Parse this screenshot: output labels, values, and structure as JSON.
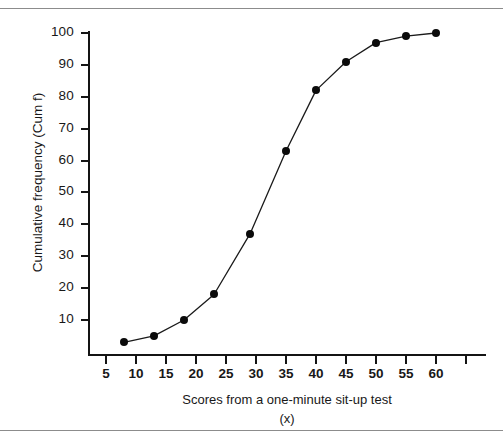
{
  "figure": {
    "top_caption": "",
    "x_axis_title": "Scores from a one-minute sit-up test",
    "x_axis_subtitle": "(x)",
    "y_axis_title": "Cumulative frequency (Cum f)"
  },
  "colors": {
    "line": "#1a1a1a",
    "marker": "#0b0b0b",
    "axis": "#141414",
    "rule": "#8c8c8c",
    "background": "#ffffff"
  },
  "chart_data": {
    "type": "line",
    "title": "",
    "xlabel": "Scores from a one-minute sit-up test (x)",
    "ylabel": "Cumulative frequency (Cum f)",
    "xlim": [
      2,
      65
    ],
    "ylim": [
      0,
      104
    ],
    "grid": false,
    "legend": "none",
    "xticks": [
      5,
      10,
      15,
      20,
      25,
      30,
      35,
      40,
      45,
      50,
      55,
      60
    ],
    "yticks": [
      10,
      20,
      30,
      40,
      50,
      60,
      70,
      80,
      90,
      100
    ],
    "x": [
      8,
      13,
      18,
      23,
      29,
      35,
      40,
      45,
      50,
      55,
      60
    ],
    "y": [
      3,
      5,
      10,
      18,
      37,
      63,
      82,
      91,
      97,
      99,
      100
    ],
    "series": [
      {
        "name": "Cumulative frequency",
        "points": [
          {
            "x": 8,
            "y": 3
          },
          {
            "x": 13,
            "y": 5
          },
          {
            "x": 18,
            "y": 10
          },
          {
            "x": 23,
            "y": 18
          },
          {
            "x": 29,
            "y": 37
          },
          {
            "x": 35,
            "y": 63
          },
          {
            "x": 40,
            "y": 82
          },
          {
            "x": 45,
            "y": 91
          },
          {
            "x": 50,
            "y": 97
          },
          {
            "x": 55,
            "y": 99
          },
          {
            "x": 60,
            "y": 100
          }
        ],
        "marker": "filled-circle",
        "line_style": "solid"
      }
    ]
  }
}
